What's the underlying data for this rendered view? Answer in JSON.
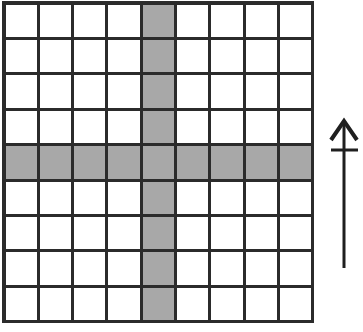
{
  "figure": {
    "background_color": "#ffffff"
  },
  "grid": {
    "name": "square-grid",
    "columns": 9,
    "rows": 9,
    "origin_x": 4,
    "origin_y": 3,
    "cell_width": 34.3,
    "cell_height": 35.4,
    "line_color": "#2b2b2b",
    "line_width": 3,
    "outer_line_width": 3.5,
    "cell_fill_empty": "#ffffff",
    "cell_fill_shaded": "#a8a8a8",
    "shaded_column_index": 5,
    "shaded_row_index": 5,
    "shaded_cell_count": 17,
    "shape_description": "cross",
    "cells": [
      [
        "empty",
        "empty",
        "empty",
        "empty",
        "shaded",
        "empty",
        "empty",
        "empty",
        "empty"
      ],
      [
        "empty",
        "empty",
        "empty",
        "empty",
        "shaded",
        "empty",
        "empty",
        "empty",
        "empty"
      ],
      [
        "empty",
        "empty",
        "empty",
        "empty",
        "shaded",
        "empty",
        "empty",
        "empty",
        "empty"
      ],
      [
        "empty",
        "empty",
        "empty",
        "empty",
        "shaded",
        "empty",
        "empty",
        "empty",
        "empty"
      ],
      [
        "shaded",
        "shaded",
        "shaded",
        "shaded",
        "shaded",
        "shaded",
        "shaded",
        "shaded",
        "shaded"
      ],
      [
        "empty",
        "empty",
        "empty",
        "empty",
        "shaded",
        "empty",
        "empty",
        "empty",
        "empty"
      ],
      [
        "empty",
        "empty",
        "empty",
        "empty",
        "shaded",
        "empty",
        "empty",
        "empty",
        "empty"
      ],
      [
        "empty",
        "empty",
        "empty",
        "empty",
        "shaded",
        "empty",
        "empty",
        "empty",
        "empty"
      ],
      [
        "empty",
        "empty",
        "empty",
        "empty",
        "shaded",
        "empty",
        "empty",
        "empty",
        "empty"
      ]
    ]
  },
  "arrow": {
    "name": "up-arrow-with-tick",
    "direction": "up",
    "color": "#1f1f1f",
    "shaft_x": 344,
    "shaft_top_y": 124,
    "shaft_bottom_y": 268,
    "shaft_width": 3,
    "head_tip_y": 121,
    "head_half_width": 13,
    "head_base_y": 140,
    "head_stroke_width": 4,
    "tick_y": 150,
    "tick_x_start": 331,
    "tick_x_end": 358,
    "tick_width": 3
  }
}
